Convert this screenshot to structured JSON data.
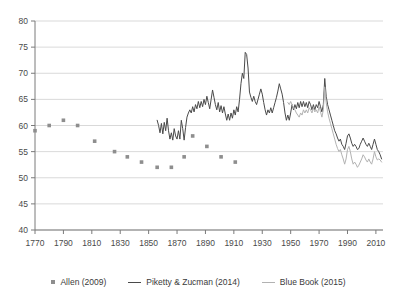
{
  "chart_data": {
    "type": "line",
    "title": "",
    "xlabel": "",
    "ylabel": "",
    "xlim": [
      1770,
      2015
    ],
    "ylim": [
      40,
      80
    ],
    "grid": true,
    "legend_position": "bottom",
    "xticks": [
      1770,
      1790,
      1810,
      1830,
      1850,
      1870,
      1890,
      1910,
      1930,
      1950,
      1970,
      1990,
      2010
    ],
    "yticks": [
      40,
      45,
      50,
      55,
      60,
      65,
      70,
      75,
      80
    ],
    "colors": {
      "allen": "#8e8e8e",
      "piketty": "#4a4a4a",
      "bluebook": "#b2b2b2",
      "grid": "#c8c8c8",
      "axis": "#7a7a7a"
    },
    "series": [
      {
        "name": "Allen (2009)",
        "type": "scatter",
        "marker": "square",
        "color": "#8e8e8e",
        "points": [
          [
            1770,
            59
          ],
          [
            1780,
            60
          ],
          [
            1790,
            61
          ],
          [
            1800,
            60
          ],
          [
            1812,
            57
          ],
          [
            1826,
            55
          ],
          [
            1835,
            54
          ],
          [
            1845,
            53
          ],
          [
            1856,
            52
          ],
          [
            1866,
            52
          ],
          [
            1875,
            54
          ],
          [
            1881,
            58
          ],
          [
            1891,
            56
          ],
          [
            1901,
            54
          ],
          [
            1911,
            53
          ]
        ]
      },
      {
        "name": "Piketty & Zucman (2014)",
        "type": "line",
        "color": "#4a4a4a",
        "x_start": 1856,
        "values": [
          [
            1856,
            61.0
          ],
          [
            1857,
            60.0
          ],
          [
            1858,
            58.6
          ],
          [
            1859,
            60.4
          ],
          [
            1860,
            58.4
          ],
          [
            1861,
            60.6
          ],
          [
            1862,
            59.0
          ],
          [
            1863,
            61.4
          ],
          [
            1864,
            59.0
          ],
          [
            1865,
            57.4
          ],
          [
            1866,
            58.6
          ],
          [
            1867,
            57.2
          ],
          [
            1868,
            59.4
          ],
          [
            1869,
            58.0
          ],
          [
            1870,
            57.4
          ],
          [
            1871,
            59.0
          ],
          [
            1872,
            57.4
          ],
          [
            1873,
            61.0
          ],
          [
            1874,
            59.4
          ],
          [
            1875,
            57.2
          ],
          [
            1876,
            59.6
          ],
          [
            1877,
            61.6
          ],
          [
            1878,
            62.4
          ],
          [
            1879,
            63.0
          ],
          [
            1880,
            62.4
          ],
          [
            1881,
            63.6
          ],
          [
            1882,
            62.6
          ],
          [
            1883,
            64.0
          ],
          [
            1884,
            63.2
          ],
          [
            1885,
            64.6
          ],
          [
            1886,
            63.4
          ],
          [
            1887,
            64.6
          ],
          [
            1888,
            63.6
          ],
          [
            1889,
            65.0
          ],
          [
            1890,
            64.0
          ],
          [
            1891,
            65.6
          ],
          [
            1892,
            64.4
          ],
          [
            1893,
            63.2
          ],
          [
            1894,
            65.0
          ],
          [
            1895,
            66.8
          ],
          [
            1896,
            65.4
          ],
          [
            1897,
            64.0
          ],
          [
            1898,
            63.0
          ],
          [
            1899,
            64.4
          ],
          [
            1900,
            62.6
          ],
          [
            1901,
            63.8
          ],
          [
            1902,
            62.4
          ],
          [
            1903,
            63.6
          ],
          [
            1904,
            62.2
          ],
          [
            1905,
            61.0
          ],
          [
            1906,
            62.2
          ],
          [
            1907,
            61.0
          ],
          [
            1908,
            62.4
          ],
          [
            1909,
            61.4
          ],
          [
            1910,
            63.0
          ],
          [
            1911,
            62.0
          ],
          [
            1912,
            63.6
          ],
          [
            1913,
            62.6
          ],
          [
            1914,
            65.0
          ],
          [
            1915,
            68.0
          ],
          [
            1916,
            70.0
          ],
          [
            1917,
            69.0
          ],
          [
            1918,
            74.0
          ],
          [
            1919,
            73.6
          ],
          [
            1920,
            71.0
          ],
          [
            1921,
            66.4
          ],
          [
            1922,
            65.4
          ],
          [
            1923,
            64.6
          ],
          [
            1924,
            65.6
          ],
          [
            1925,
            64.6
          ],
          [
            1926,
            64.0
          ],
          [
            1927,
            65.0
          ],
          [
            1928,
            66.0
          ],
          [
            1929,
            67.0
          ],
          [
            1930,
            66.0
          ],
          [
            1931,
            64.4
          ],
          [
            1932,
            63.0
          ],
          [
            1933,
            62.0
          ],
          [
            1934,
            63.0
          ],
          [
            1935,
            62.4
          ],
          [
            1936,
            63.4
          ],
          [
            1937,
            62.4
          ],
          [
            1938,
            63.4
          ],
          [
            1939,
            64.4
          ],
          [
            1940,
            65.4
          ],
          [
            1941,
            66.6
          ],
          [
            1942,
            68.0
          ],
          [
            1943,
            67.0
          ],
          [
            1944,
            66.0
          ],
          [
            1945,
            64.4
          ],
          [
            1946,
            62.4
          ],
          [
            1947,
            61.0
          ],
          [
            1948,
            62.0
          ],
          [
            1949,
            61.0
          ],
          [
            1950,
            62.4
          ],
          [
            1951,
            64.0
          ],
          [
            1952,
            63.0
          ],
          [
            1953,
            64.0
          ],
          [
            1954,
            63.2
          ],
          [
            1955,
            64.4
          ],
          [
            1956,
            63.4
          ],
          [
            1957,
            64.6
          ],
          [
            1958,
            63.6
          ],
          [
            1959,
            64.6
          ],
          [
            1960,
            63.6
          ],
          [
            1961,
            64.4
          ],
          [
            1962,
            63.4
          ],
          [
            1963,
            64.6
          ],
          [
            1964,
            64.0
          ],
          [
            1965,
            63.0
          ],
          [
            1966,
            64.0
          ],
          [
            1967,
            63.0
          ],
          [
            1968,
            64.0
          ],
          [
            1969,
            63.4
          ],
          [
            1970,
            64.6
          ],
          [
            1971,
            63.6
          ],
          [
            1972,
            62.6
          ],
          [
            1973,
            64.0
          ],
          [
            1974,
            69.0
          ],
          [
            1975,
            65.6
          ],
          [
            1976,
            64.0
          ],
          [
            1977,
            63.0
          ],
          [
            1978,
            62.0
          ],
          [
            1979,
            61.0
          ],
          [
            1980,
            60.0
          ],
          [
            1981,
            59.0
          ],
          [
            1982,
            58.4
          ],
          [
            1983,
            57.6
          ],
          [
            1984,
            57.0
          ],
          [
            1985,
            57.4
          ],
          [
            1986,
            56.4
          ],
          [
            1987,
            56.0
          ],
          [
            1988,
            55.4
          ],
          [
            1989,
            56.6
          ],
          [
            1990,
            58.0
          ],
          [
            1991,
            58.4
          ],
          [
            1992,
            57.6
          ],
          [
            1993,
            56.6
          ],
          [
            1994,
            56.0
          ],
          [
            1995,
            56.4
          ],
          [
            1996,
            56.0
          ],
          [
            1997,
            55.4
          ],
          [
            1998,
            55.6
          ],
          [
            1999,
            56.4
          ],
          [
            2000,
            57.0
          ],
          [
            2001,
            57.6
          ],
          [
            2002,
            57.0
          ],
          [
            2003,
            56.4
          ],
          [
            2004,
            56.0
          ],
          [
            2005,
            56.6
          ],
          [
            2006,
            56.0
          ],
          [
            2007,
            55.4
          ],
          [
            2008,
            56.4
          ],
          [
            2009,
            57.4
          ],
          [
            2010,
            56.4
          ],
          [
            2011,
            55.4
          ],
          [
            2012,
            55.0
          ],
          [
            2013,
            54.4
          ],
          [
            2014,
            53.6
          ]
        ]
      },
      {
        "name": "Blue Book (2015)",
        "type": "line",
        "color": "#b2b2b2",
        "x_start": 1948,
        "values": [
          [
            1948,
            64.4
          ],
          [
            1949,
            64.0
          ],
          [
            1950,
            64.6
          ],
          [
            1951,
            64.0
          ],
          [
            1952,
            63.4
          ],
          [
            1953,
            63.0
          ],
          [
            1954,
            62.4
          ],
          [
            1955,
            62.0
          ],
          [
            1956,
            61.6
          ],
          [
            1957,
            62.4
          ],
          [
            1958,
            62.0
          ],
          [
            1959,
            63.0
          ],
          [
            1960,
            62.4
          ],
          [
            1961,
            63.0
          ],
          [
            1962,
            62.4
          ],
          [
            1963,
            63.4
          ],
          [
            1964,
            63.0
          ],
          [
            1965,
            62.4
          ],
          [
            1966,
            63.4
          ],
          [
            1967,
            62.6
          ],
          [
            1968,
            63.0
          ],
          [
            1969,
            62.4
          ],
          [
            1970,
            63.6
          ],
          [
            1971,
            62.6
          ],
          [
            1972,
            61.6
          ],
          [
            1973,
            63.0
          ],
          [
            1974,
            67.4
          ],
          [
            1975,
            64.4
          ],
          [
            1976,
            62.6
          ],
          [
            1977,
            61.4
          ],
          [
            1978,
            60.4
          ],
          [
            1979,
            59.4
          ],
          [
            1980,
            58.4
          ],
          [
            1981,
            57.4
          ],
          [
            1982,
            56.4
          ],
          [
            1983,
            55.6
          ],
          [
            1984,
            55.0
          ],
          [
            1985,
            55.4
          ],
          [
            1986,
            54.4
          ],
          [
            1987,
            53.6
          ],
          [
            1988,
            52.6
          ],
          [
            1989,
            53.6
          ],
          [
            1990,
            55.4
          ],
          [
            1991,
            56.0
          ],
          [
            1992,
            55.0
          ],
          [
            1993,
            53.6
          ],
          [
            1994,
            52.6
          ],
          [
            1995,
            53.0
          ],
          [
            1996,
            52.6
          ],
          [
            1997,
            52.0
          ],
          [
            1998,
            52.4
          ],
          [
            1999,
            53.0
          ],
          [
            2000,
            53.6
          ],
          [
            2001,
            54.4
          ],
          [
            2002,
            54.0
          ],
          [
            2003,
            53.4
          ],
          [
            2004,
            53.0
          ],
          [
            2005,
            53.6
          ],
          [
            2006,
            53.0
          ],
          [
            2007,
            52.6
          ],
          [
            2008,
            53.6
          ],
          [
            2009,
            55.0
          ],
          [
            2010,
            54.0
          ],
          [
            2011,
            53.4
          ],
          [
            2012,
            53.6
          ],
          [
            2013,
            53.4
          ],
          [
            2014,
            53.0
          ]
        ]
      }
    ]
  },
  "legend": {
    "items": [
      {
        "label": "Allen (2009)",
        "marker": "square",
        "color": "#8e8e8e"
      },
      {
        "label": "Piketty & Zucman (2014)",
        "marker": "line",
        "color": "#4a4a4a"
      },
      {
        "label": "Blue Book (2015)",
        "marker": "line-light",
        "color": "#b2b2b2"
      }
    ]
  }
}
